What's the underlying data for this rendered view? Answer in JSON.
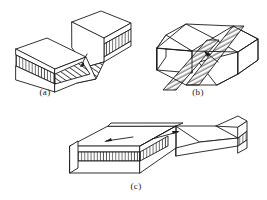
{
  "figure": {
    "background_color": "#ffffff",
    "line_color": "#1a1a1a",
    "panels": [
      {
        "id": "a",
        "caption": "(a)",
        "caption_x": 45,
        "caption_y": 95,
        "type": "normal-fault-block-diagram",
        "description": "Block diagram of a dip-slip (normal) fault: a raised hanging-wall block at upper right offset from a lower foot-wall block at lower left, with a hatched marker bed and a hatched fault plane.",
        "arrow_count": 1
      },
      {
        "id": "b",
        "caption": "(b)",
        "caption_x": 198,
        "caption_y": 95,
        "type": "strike-slip-fault-block-diagram",
        "description": "Block diagram of a strike-slip fault: a single block cut by a steeply inclined hatched fault plane running diagonally across the block, with a displacement arrow on the near face.",
        "arrow_count": 1
      },
      {
        "id": "c",
        "caption": "(c)",
        "caption_x": 136,
        "caption_y": 189,
        "type": "oblique-slip-fault-block-diagram",
        "description": "Wide block diagram of an oblique-slip fault: a broad slab with a hatched marker bed along the front face, offset across a fault, with two opposed arrows on the top surface indicating lateral shear.",
        "arrow_count": 2
      }
    ]
  },
  "legend": {
    "hatch_vertical_label": "marker-bed-hatching",
    "hatch_diagonal_label": "fault-plane-hatching",
    "arrow_label": "slip-direction-arrow"
  }
}
